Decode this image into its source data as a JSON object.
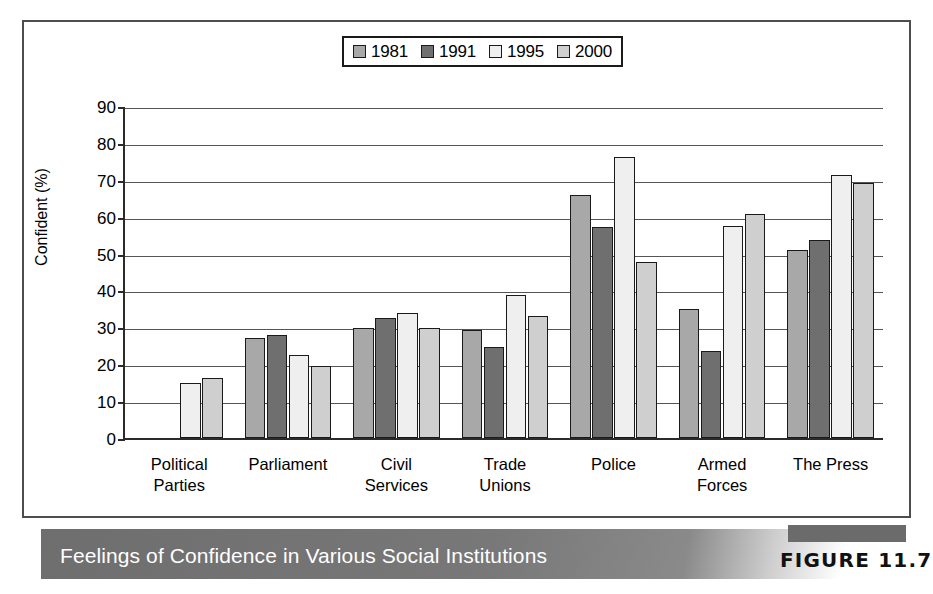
{
  "figure": {
    "caption": "Feelings of Confidence in Various Social Institutions",
    "figure_tag": "FIGURE 11.7"
  },
  "chart_data": {
    "type": "bar",
    "title": "Feelings of Confidence in Various Social Institutions",
    "xlabel": "",
    "ylabel": "Confident (%)",
    "ylim": [
      0,
      90
    ],
    "ytick_step": 10,
    "yticks": [
      "90",
      "80",
      "70",
      "60",
      "50",
      "40",
      "30",
      "20",
      "10",
      "0"
    ],
    "grid": true,
    "legend_position": "top-center",
    "categories": [
      "Political Parties",
      "Parliament",
      "Civil Services",
      "Trade Unions",
      "Police",
      "Armed Forces",
      "The Press"
    ],
    "category_lines": [
      [
        "Political",
        "Parties"
      ],
      [
        "Parliament",
        ""
      ],
      [
        "Civil",
        "Services"
      ],
      [
        "Trade",
        "Unions"
      ],
      [
        "Police",
        ""
      ],
      [
        "Armed",
        "Forces"
      ],
      [
        "The Press",
        ""
      ]
    ],
    "series": [
      {
        "name": "1981",
        "color": "#a8a8a8",
        "values": [
          null,
          27.0,
          29.7,
          29.4,
          66.0,
          35.0,
          51.0
        ]
      },
      {
        "name": "1991",
        "color": "#6f6f6f",
        "values": [
          null,
          28.0,
          32.5,
          24.7,
          57.2,
          23.5,
          53.6
        ]
      },
      {
        "name": "1995",
        "color": "#efefef",
        "values": [
          15.0,
          22.5,
          33.8,
          38.8,
          76.2,
          57.5,
          71.2
        ]
      },
      {
        "name": "2000",
        "color": "#cfcfcf",
        "values": [
          16.3,
          19.4,
          29.7,
          33.2,
          47.7,
          60.6,
          69.2
        ]
      }
    ]
  }
}
